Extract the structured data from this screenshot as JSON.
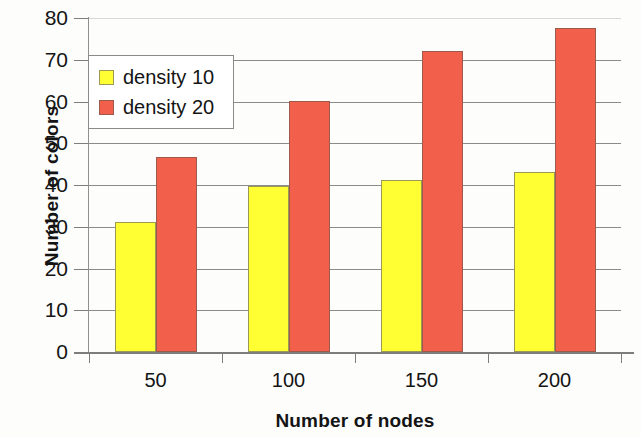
{
  "chart_data": {
    "type": "bar",
    "title": "",
    "xlabel": "Number of nodes",
    "ylabel": "Number of colors",
    "categories": [
      "50",
      "100",
      "150",
      "200"
    ],
    "series": [
      {
        "name": "density 10",
        "color": "#ffff33",
        "values": [
          31.2,
          39.7,
          41.1,
          43.1
        ]
      },
      {
        "name": "density 20",
        "color": "#f2604c",
        "values": [
          46.7,
          60.1,
          72.0,
          77.6
        ]
      }
    ],
    "ylim": [
      0,
      80
    ],
    "ytick_labels": [
      "0",
      "10",
      "20",
      "30",
      "40",
      "50",
      "60",
      "70",
      "80"
    ],
    "ytick_values": [
      0,
      10,
      20,
      30,
      40,
      50,
      60,
      70,
      80
    ],
    "grid": true,
    "legend_position": "upper-left"
  },
  "legend": {
    "entries": [
      {
        "label": "density 10"
      },
      {
        "label": "density 20"
      }
    ]
  }
}
